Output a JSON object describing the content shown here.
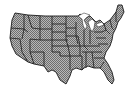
{
  "map": {
    "title": "United States map",
    "fill_pattern": "checkered-gray",
    "colors": {
      "background": "#ffffff",
      "fill_light": "#b8b8b8",
      "fill_dark": "#6e6e6e",
      "border": "#1a1a1a",
      "lakes": "#ffffff"
    },
    "regions": [
      "West",
      "Mountain",
      "Plains",
      "Midwest",
      "South",
      "Northeast",
      "Southeast"
    ]
  }
}
